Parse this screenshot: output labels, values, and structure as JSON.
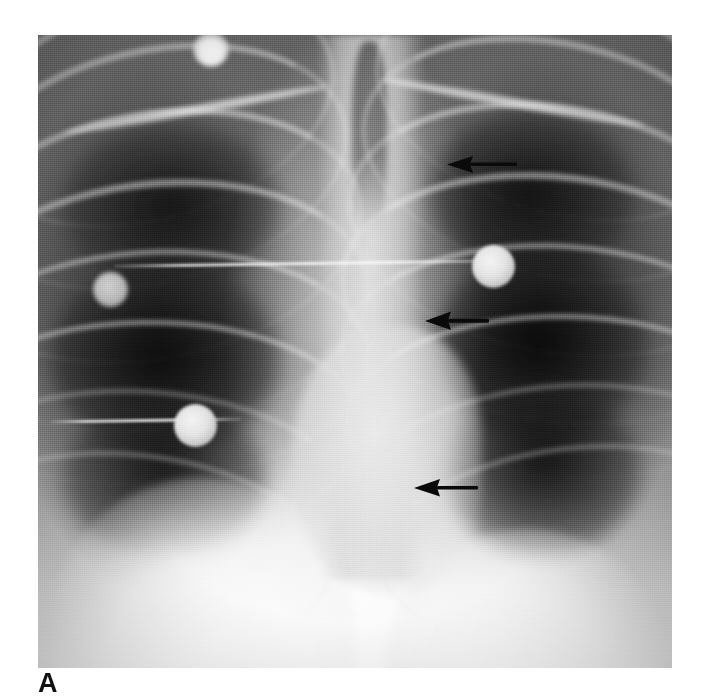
{
  "figure": {
    "panel_letter": "A",
    "modality": "chest-radiograph",
    "view": "frontal-AP",
    "caption_visible": false
  },
  "image": {
    "name": "chest-xray-frontal",
    "left": 38,
    "top": 35,
    "width": 634,
    "height": 633,
    "background_hex": "#8a8a8a"
  },
  "colors": {
    "film_mid_gray": "#8a8a8a",
    "lung_dark": "#2a2a2a",
    "bone_light": "#ededed",
    "diaphragm_white": "#ffffff",
    "annotation_black": "#0a0a0a",
    "label_black": "#111111",
    "page_white": "#ffffff"
  },
  "annotations": {
    "arrows": [
      {
        "name": "arrow-upper",
        "label": "",
        "direction": "left",
        "tip_x": 447,
        "tip_y": 164,
        "tail_x": 506,
        "tail_y": 163,
        "points_at": "upper-mediastinal-border"
      },
      {
        "name": "arrow-middle",
        "label": "",
        "direction": "left",
        "tip_x": 425,
        "tip_y": 322,
        "tail_x": 477,
        "tail_y": 320,
        "points_at": "mid-mediastinal-border"
      },
      {
        "name": "arrow-lower",
        "label": "",
        "direction": "left",
        "tip_x": 414,
        "tip_y": 488,
        "tail_x": 466,
        "tail_y": 487,
        "points_at": "lower-mediastinal-border"
      }
    ],
    "devices": [
      {
        "name": "ecg-electrode-upper-right",
        "cx": 496,
        "cy": 268,
        "r": 21,
        "brightness": "bright"
      },
      {
        "name": "ecg-electrode-lower-left",
        "cx": 198,
        "cy": 428,
        "r": 21,
        "brightness": "bright"
      },
      {
        "name": "ecg-electrode-mid-left",
        "cx": 115,
        "cy": 290,
        "r": 17,
        "brightness": "dim"
      },
      {
        "name": "radiopaque-object-apex",
        "cx": 208,
        "cy": 44,
        "r": 17,
        "brightness": "bright"
      }
    ],
    "lead_wires": [
      {
        "name": "lead-wire-upper",
        "x1": 120,
        "y1": 268,
        "x2": 500,
        "y2": 262
      },
      {
        "name": "lead-wire-lower",
        "x1": 58,
        "y1": 424,
        "x2": 205,
        "y2": 420
      }
    ]
  }
}
